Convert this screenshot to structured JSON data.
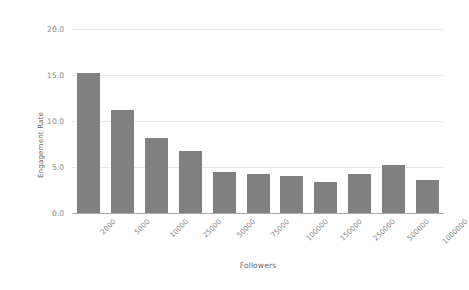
{
  "chart_data": {
    "type": "bar",
    "title": "",
    "xlabel": "Followers",
    "ylabel": "Engagement Rate",
    "categories": [
      "2000",
      "5000",
      "10000",
      "25000",
      "50000",
      "75000",
      "100000",
      "150000",
      "250000",
      "500000",
      "1000000"
    ],
    "values": [
      15.2,
      11.2,
      8.2,
      6.7,
      4.5,
      4.2,
      4.0,
      3.4,
      4.2,
      5.2,
      3.6
    ],
    "ylim": [
      0.0,
      20.0
    ],
    "yticks": [
      "0.0",
      "5.0",
      "10.0",
      "15.0",
      "20.0"
    ],
    "ytick_values": [
      0.0,
      5.0,
      10.0,
      15.0,
      20.0
    ],
    "grid": true,
    "legend": "none",
    "bar_color": "#808080",
    "grid_color": "#e8e8e8",
    "axis_color": "#a9a9a9",
    "tick_label_color": "#8a8a8a",
    "axis_title_color": "#6b6b6b",
    "background_color": "#ffffff",
    "xtick_rotation": -45
  }
}
